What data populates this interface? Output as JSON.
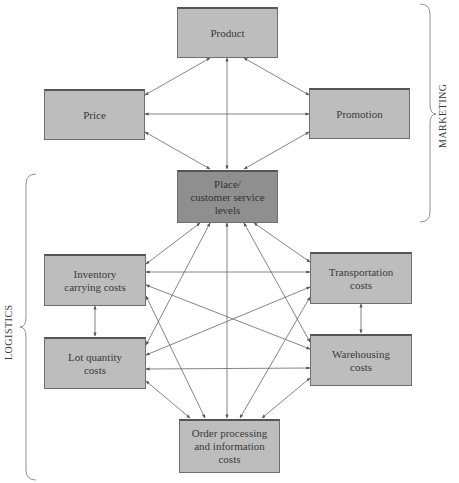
{
  "diagram": {
    "groups": {
      "marketing": "MARKETING",
      "logistics": "LOGISTICS"
    },
    "nodes": {
      "product": "Product",
      "price": "Price",
      "promotion": "Promotion",
      "place": "Place/\ncustomer service\nlevels",
      "inventory": "Inventory\ncarrying costs",
      "transportation": "Transportation\ncosts",
      "lot_quantity": "Lot quantity\ncosts",
      "warehousing": "Warehousing\ncosts",
      "order_processing": "Order processing\nand information\ncosts"
    },
    "colors": {
      "box_fill": "#bdbdbd",
      "center_fill": "#8f8f8f",
      "line": "#555555"
    }
  }
}
